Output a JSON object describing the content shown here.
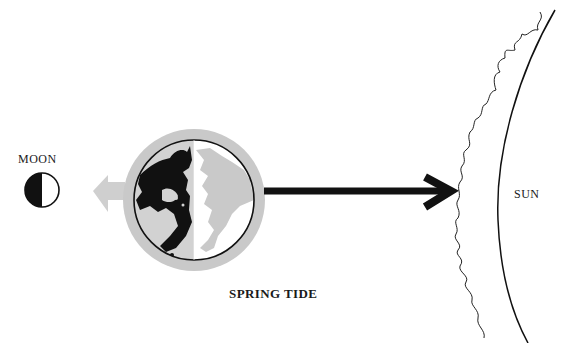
{
  "diagram": {
    "title": "SPRING TIDE",
    "bodies": {
      "moon": {
        "label": "MOON",
        "phase": "half (left dark)"
      },
      "earth": {
        "label": "",
        "description": "Earth viewed from north pole, half lit, with tidal bulge"
      },
      "sun": {
        "label": "SUN"
      }
    },
    "arrows": [
      {
        "name": "moon-pull-arrow",
        "direction": "toward moon",
        "style": "grey block arrow"
      },
      {
        "name": "sun-pull-arrow",
        "direction": "toward sun",
        "style": "black line arrow"
      }
    ],
    "colors": {
      "ink": "#111111",
      "bulge_grey": "#c8c8c8",
      "land_grey": "#d4d4d4",
      "arrow_grey": "#cfcfcf",
      "background": "#ffffff"
    }
  }
}
